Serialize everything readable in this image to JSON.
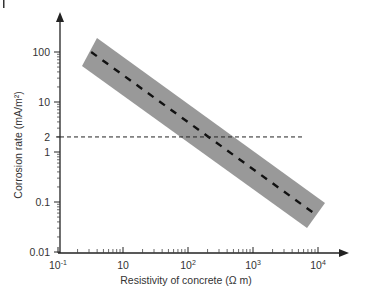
{
  "chart_data": {
    "type": "line",
    "title": "",
    "xlabel": "Resistivity of concrete (Ω m)",
    "ylabel": "Corrosion rate (mA/m²)",
    "xscale": "log",
    "yscale": "log",
    "x_tick_labels": [
      {
        "base": "10",
        "exp": "-1",
        "pos_decade": 0
      },
      {
        "base": "10",
        "exp": "",
        "pos_decade": 1
      },
      {
        "base": "10",
        "exp": "2",
        "pos_decade": 2
      },
      {
        "base": "10",
        "exp": "3",
        "pos_decade": 3
      },
      {
        "base": "10",
        "exp": "4",
        "pos_decade": 4
      }
    ],
    "y_tick_labels": [
      {
        "label": "100",
        "value": 100
      },
      {
        "label": "10",
        "value": 10
      },
      {
        "label": "2",
        "value": 2
      },
      {
        "label": "1",
        "value": 1
      },
      {
        "label": "0.1",
        "value": 0.1
      },
      {
        "label": "0.01",
        "value": 0.01
      }
    ],
    "ylim": [
      0.01,
      300
    ],
    "xlim_decades": [
      0,
      4.5
    ],
    "grid": false,
    "legend": null,
    "series": [
      {
        "name": "Mean trend (dashed)",
        "style": "dashed-thick",
        "color": "#111111",
        "x_decade": [
          0.51,
          3.95
        ],
        "y": [
          100,
          0.058
        ]
      },
      {
        "name": "Threshold 2 mA/m²",
        "style": "dashed-thin",
        "color": "#222222",
        "x_decade": [
          0,
          3.8
        ],
        "y": [
          2,
          2
        ]
      }
    ],
    "band": {
      "name": "Scatter band",
      "color": "#999999",
      "polygon_px": [
        [
          97,
          38
        ],
        [
          325,
          203
        ],
        [
          307,
          228
        ],
        [
          82,
          66
        ]
      ]
    }
  },
  "axes": {
    "x_title": "Resistivity of concrete (Ω m)",
    "y_title": "Corrosion rate (mA/m²)"
  }
}
